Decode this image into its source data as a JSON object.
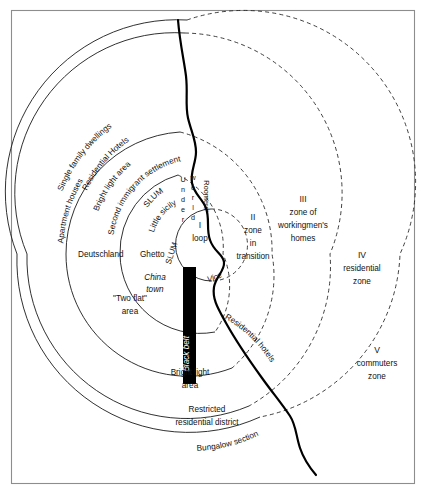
{
  "figure": {
    "name": "concentric-zone-model",
    "border_color": "#8d8d8d",
    "line_color": "#1a1a1a",
    "belt_color": "#000000"
  },
  "zones": [
    {
      "numeral": "I",
      "line1": "loop",
      "line2": "",
      "line3": ""
    },
    {
      "numeral": "II",
      "line1": "zone",
      "line2": "in",
      "line3": "transition"
    },
    {
      "numeral": "III",
      "line1": "zone of",
      "line2": "workingmen's",
      "line3": "homes"
    },
    {
      "numeral": "IV",
      "line1": "residential",
      "line2": "zone",
      "line3": ""
    },
    {
      "numeral": "V",
      "line1": "commuters",
      "line2": "zone",
      "line3": ""
    }
  ],
  "curved_labels": [
    {
      "id": "single-family-dwellings",
      "text": "Single family dwellings"
    },
    {
      "id": "residential-hotels-outer",
      "text": "Residential Hotels"
    },
    {
      "id": "bright-light-area-upper",
      "text": "Bright light area"
    },
    {
      "id": "apartment-houses",
      "text": "Apartment houses"
    },
    {
      "id": "second-immigrant-settlement",
      "text": "Second immigrant settlement"
    },
    {
      "id": "slum-upper",
      "text": "SLUM"
    },
    {
      "id": "little-sicily",
      "text": "Little sicily"
    },
    {
      "id": "vice",
      "text": "Vice"
    },
    {
      "id": "residential-hotels-lower",
      "text": "Residential hotels"
    },
    {
      "id": "bungalow-section",
      "text": "Bungalow section"
    },
    {
      "id": "black-belt",
      "text": "Black belt"
    }
  ],
  "flat_labels": [
    {
      "id": "deutschland",
      "text": "Deutschland"
    },
    {
      "id": "ghetto",
      "text": "Ghetto"
    },
    {
      "id": "slum-vertical",
      "text": "SLUM"
    },
    {
      "id": "china-town-1",
      "text": "China"
    },
    {
      "id": "china-town-2",
      "text": "town"
    },
    {
      "id": "two-flat-area-1",
      "text": "\"Two flat\""
    },
    {
      "id": "two-flat-area-2",
      "text": "area"
    },
    {
      "id": "bright-light-area-1",
      "text": "Bright light"
    },
    {
      "id": "bright-light-area-2",
      "text": "area"
    },
    {
      "id": "restricted-residential-1",
      "text": "Restricted"
    },
    {
      "id": "restricted-residential-2",
      "text": "residential district"
    }
  ],
  "stacked_labels": [
    {
      "id": "underworld",
      "letters": [
        "U",
        "n",
        "d",
        "e",
        "r"
      ],
      "letters2": [
        "w",
        "o",
        "r",
        "l",
        "d"
      ]
    },
    {
      "id": "roomers",
      "text": "Roomers'"
    }
  ]
}
